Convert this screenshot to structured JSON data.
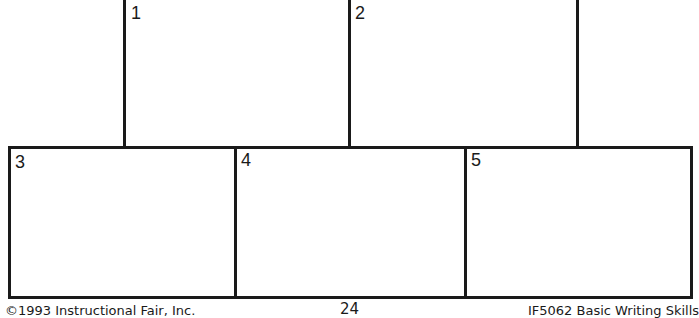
{
  "worksheet": {
    "top_panels": [
      {
        "number": "1"
      },
      {
        "number": "2"
      }
    ],
    "bottom_boxes": [
      {
        "number": "3"
      },
      {
        "number": "4"
      },
      {
        "number": "5"
      }
    ]
  },
  "footer": {
    "copyright": "©1993 Instructional Fair, Inc.",
    "page_number": "24",
    "book_title": "IF5062 Basic Writing Skills"
  },
  "colors": {
    "line": "#1a1a1a",
    "background": "#ffffff"
  }
}
